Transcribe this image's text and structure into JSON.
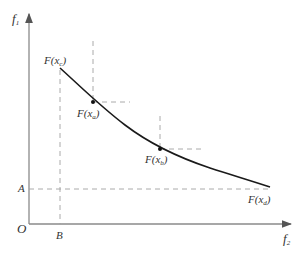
{
  "diagram": {
    "type": "pareto-front",
    "axes": {
      "y_label": {
        "main": "f",
        "sub": "1"
      },
      "x_label": {
        "main": "f",
        "sub": "2"
      },
      "origin_label": "O"
    },
    "reference_labels": {
      "A": "A",
      "B": "B"
    },
    "points": [
      {
        "id": "c",
        "label_main": "F(x",
        "label_sub": "c",
        "label_end": ")"
      },
      {
        "id": "a",
        "label_main": "F(x",
        "label_sub": "a",
        "label_end": ")"
      },
      {
        "id": "b",
        "label_main": "F(x",
        "label_sub": "b",
        "label_end": ")"
      },
      {
        "id": "d",
        "label_main": "F(x",
        "label_sub": "d",
        "label_end": ")"
      }
    ],
    "colors": {
      "curve": "#1a1a1a",
      "axis": "#888888",
      "dashed": "#999999"
    }
  }
}
